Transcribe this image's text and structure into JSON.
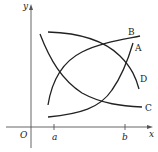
{
  "diagram": {
    "axes": {
      "x_label": "x",
      "y_label": "y",
      "origin_label": "O",
      "ticks": [
        {
          "label": "a"
        },
        {
          "label": "b"
        }
      ]
    },
    "curves": [
      {
        "label": "A",
        "description": "increasing, concave up"
      },
      {
        "label": "B",
        "description": "increasing, concave down"
      },
      {
        "label": "C",
        "description": "decreasing, concave up"
      },
      {
        "label": "D",
        "description": "decreasing, concave down"
      }
    ],
    "colors": {
      "stroke": "#222222",
      "axis": "#555555",
      "background": "#ffffff"
    }
  }
}
